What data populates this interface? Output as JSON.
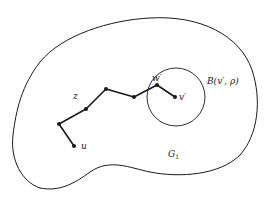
{
  "diagram": {
    "region_label": "G",
    "region_label_subscript": "1",
    "ball_label": "B(v′, ρ)",
    "vertex_labels": {
      "u": "u",
      "z": "z",
      "w_prime": "w′",
      "v_prime": "v′"
    },
    "path": {
      "points": [
        [
          74,
          146
        ],
        [
          59,
          124
        ],
        [
          86,
          109
        ],
        [
          106,
          89
        ],
        [
          134,
          97
        ],
        [
          157,
          85
        ],
        [
          175,
          97
        ]
      ],
      "color": "#1a1a1a"
    },
    "ball": {
      "cx": 176,
      "cy": 97,
      "r": 29
    },
    "colors": {
      "stroke": "#1a1a1a",
      "background": "#ffffff"
    }
  }
}
